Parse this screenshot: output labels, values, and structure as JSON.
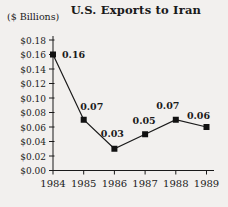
{
  "chart_data": {
    "type": "line",
    "title": "U.S. Exports to Iran",
    "unit_label": "($ Billions)",
    "categories": [
      "1984",
      "1985",
      "1986",
      "1987",
      "1988",
      "1989"
    ],
    "values": [
      0.16,
      0.07,
      0.03,
      0.05,
      0.07,
      0.06
    ],
    "data_labels": [
      "0.16",
      "0.07",
      "0.03",
      "0.05",
      "0.07",
      "0.06"
    ],
    "y_tick_labels": [
      "$0.18",
      "$0.16",
      "$0.14",
      "$0.12",
      "$0.10",
      "$0.08",
      "$0.06",
      "$0.04",
      "$0.02",
      "$0.00"
    ],
    "ylim": [
      0,
      0.18
    ],
    "xlabel": "",
    "ylabel": "($ Billions)",
    "grid": false,
    "legend": "none",
    "marker": "square",
    "colors": {
      "line": "#1a1a1a",
      "marker": "#111111",
      "text": "#1a1a1a",
      "background": "#f2f0ee"
    }
  }
}
